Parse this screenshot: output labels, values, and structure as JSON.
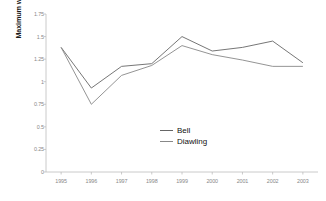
{
  "chart_data": {
    "type": "line",
    "title": "",
    "xlabel": "",
    "ylabel": "Maximum water level (m IGN)",
    "categories": [
      "1995",
      "1996",
      "1997",
      "1998",
      "1999",
      "2000",
      "2001",
      "2002",
      "2003"
    ],
    "x": [
      1995,
      1996,
      1997,
      1998,
      1999,
      2000,
      2001,
      2002,
      2003
    ],
    "series": [
      {
        "name": "Bell",
        "color": "#666666",
        "values": [
          1.38,
          0.93,
          1.17,
          1.2,
          1.5,
          1.34,
          1.38,
          1.45,
          1.21
        ]
      },
      {
        "name": "Diawling",
        "color": "#888888",
        "values": [
          1.38,
          0.75,
          1.07,
          1.18,
          1.4,
          1.3,
          1.24,
          1.17,
          1.17
        ]
      }
    ],
    "ylim": [
      0,
      1.75
    ],
    "yticks": [
      0,
      0.25,
      0.5,
      0.75,
      1,
      1.25,
      1.5,
      1.75
    ],
    "ytick_labels": [
      "0",
      "0.25",
      "0.5",
      "0.75",
      "1",
      "1.25",
      "1.5",
      "1.75"
    ],
    "xtick_labels": [
      "1995",
      "1996",
      "1997",
      "1998",
      "1999",
      "2000",
      "2001",
      "2002",
      "2003"
    ],
    "grid": false,
    "legend_position": "center"
  },
  "legend": {
    "entries": [
      {
        "label": "Bell"
      },
      {
        "label": "Diawling"
      }
    ]
  }
}
